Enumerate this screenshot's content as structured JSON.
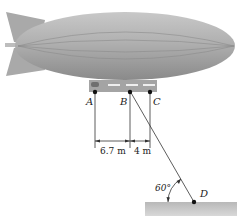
{
  "figure": {
    "points": {
      "A": "A",
      "B": "B",
      "C": "C",
      "D": "D"
    },
    "dimensions": {
      "AB": "6.7 m",
      "BC": "4 m"
    },
    "angle": "60°"
  }
}
